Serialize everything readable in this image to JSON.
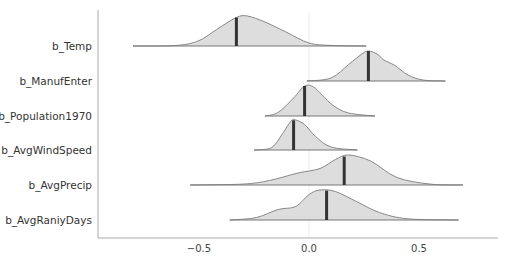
{
  "chart_data": {
    "type": "ridgeline",
    "title": "",
    "xlabel": "",
    "ylabel": "",
    "xlim": [
      -0.9,
      0.85
    ],
    "xticks": [
      -0.5,
      0.0,
      0.5
    ],
    "xtick_labels": [
      "−0.5",
      "0.0",
      "0.5"
    ],
    "grid": false,
    "zero_reference_line": true,
    "legend": null,
    "colors": {
      "fill": "#dddddd",
      "outline": "#888888",
      "median": "#333333",
      "axis": "#aaaaaa"
    },
    "series": [
      {
        "name": "b_Temp",
        "min": -0.8,
        "max": 0.26,
        "median": -0.33,
        "density": [
          [
            -0.8,
            0.0
          ],
          [
            -0.6,
            0.02
          ],
          [
            -0.5,
            0.18
          ],
          [
            -0.42,
            0.55
          ],
          [
            -0.33,
            0.95
          ],
          [
            -0.28,
            1.0
          ],
          [
            -0.2,
            0.8
          ],
          [
            -0.1,
            0.45
          ],
          [
            0.0,
            0.1
          ],
          [
            0.1,
            0.02
          ],
          [
            0.26,
            0.0
          ]
        ]
      },
      {
        "name": "b_ManufEnter",
        "min": -0.01,
        "max": 0.62,
        "median": 0.27,
        "density": [
          [
            -0.01,
            0.0
          ],
          [
            0.1,
            0.1
          ],
          [
            0.18,
            0.55
          ],
          [
            0.24,
            0.9
          ],
          [
            0.27,
            1.0
          ],
          [
            0.31,
            0.9
          ],
          [
            0.34,
            0.7
          ],
          [
            0.39,
            0.52
          ],
          [
            0.45,
            0.2
          ],
          [
            0.52,
            0.03
          ],
          [
            0.62,
            0.0
          ]
        ]
      },
      {
        "name": "b_Population1970",
        "min": -0.2,
        "max": 0.3,
        "median": -0.02,
        "density": [
          [
            -0.2,
            0.0
          ],
          [
            -0.14,
            0.12
          ],
          [
            -0.07,
            0.6
          ],
          [
            -0.02,
            1.0
          ],
          [
            0.02,
            0.97
          ],
          [
            0.06,
            0.7
          ],
          [
            0.11,
            0.35
          ],
          [
            0.18,
            0.1
          ],
          [
            0.3,
            0.0
          ]
        ]
      },
      {
        "name": "b_AvgWindSpeed",
        "min": -0.25,
        "max": 0.22,
        "median": -0.07,
        "density": [
          [
            -0.25,
            0.0
          ],
          [
            -0.17,
            0.08
          ],
          [
            -0.12,
            0.55
          ],
          [
            -0.08,
            0.98
          ],
          [
            -0.06,
            1.0
          ],
          [
            -0.02,
            0.85
          ],
          [
            0.03,
            0.45
          ],
          [
            0.1,
            0.1
          ],
          [
            0.22,
            0.0
          ]
        ]
      },
      {
        "name": "b_AvgPrecip",
        "min": -0.54,
        "max": 0.7,
        "median": 0.16,
        "density": [
          [
            -0.54,
            0.0
          ],
          [
            -0.3,
            0.03
          ],
          [
            -0.18,
            0.15
          ],
          [
            -0.05,
            0.4
          ],
          [
            0.05,
            0.55
          ],
          [
            0.12,
            0.85
          ],
          [
            0.18,
            1.0
          ],
          [
            0.28,
            0.8
          ],
          [
            0.4,
            0.25
          ],
          [
            0.55,
            0.03
          ],
          [
            0.7,
            0.0
          ]
        ]
      },
      {
        "name": "b_AvgRaniyDays",
        "min": -0.36,
        "max": 0.68,
        "median": 0.08,
        "density": [
          [
            -0.36,
            0.0
          ],
          [
            -0.24,
            0.08
          ],
          [
            -0.14,
            0.35
          ],
          [
            -0.06,
            0.45
          ],
          [
            0.0,
            0.85
          ],
          [
            0.05,
            1.0
          ],
          [
            0.12,
            0.95
          ],
          [
            0.22,
            0.6
          ],
          [
            0.32,
            0.25
          ],
          [
            0.45,
            0.04
          ],
          [
            0.68,
            0.0
          ]
        ]
      }
    ]
  },
  "layout": {
    "x_zero_px": 309,
    "px_per_unit": 220,
    "baselines_px": [
      46,
      81,
      116,
      150,
      185,
      220
    ],
    "ridge_height_px": 30
  }
}
